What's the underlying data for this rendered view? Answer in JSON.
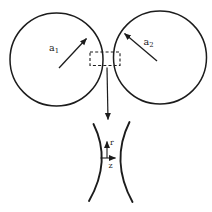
{
  "figure": {
    "background_color": "#ffffff",
    "line_color": "#1c1c1c",
    "sphere1_label": {
      "base": "a",
      "sub": "1"
    },
    "sphere2_label": {
      "base": "a",
      "sub": "2"
    },
    "neck_axes": {
      "vertical": "r",
      "horizontal": "z"
    }
  }
}
